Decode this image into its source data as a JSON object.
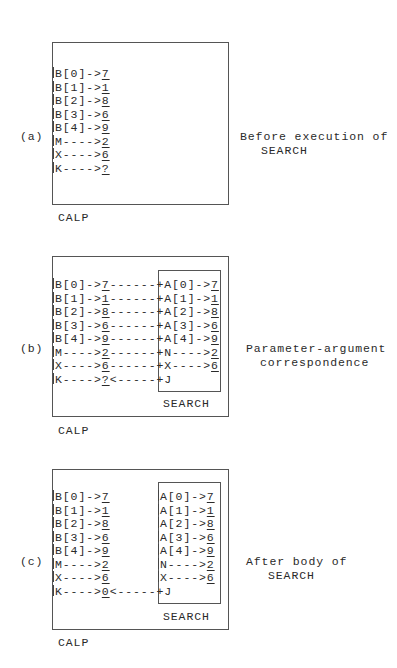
{
  "panels": [
    {
      "label": "(a)",
      "caption_line1": "Before execution of",
      "caption_line2": "SEARCH",
      "outer_box_label": "CALP",
      "has_inner_box": false,
      "rows": [
        {
          "left_name": "B[0]->",
          "left_value": "7",
          "link": "",
          "right_name": "",
          "right_value": ""
        },
        {
          "left_name": "B[1]->",
          "left_value": "1",
          "link": "",
          "right_name": "",
          "right_value": ""
        },
        {
          "left_name": "B[2]->",
          "left_value": "8",
          "link": "",
          "right_name": "",
          "right_value": ""
        },
        {
          "left_name": "B[3]->",
          "left_value": "6",
          "link": "",
          "right_name": "",
          "right_value": ""
        },
        {
          "left_name": "B[4]->",
          "left_value": "9",
          "link": "",
          "right_name": "",
          "right_value": ""
        },
        {
          "left_name": "M---->",
          "left_value": "2",
          "link": "",
          "right_name": "",
          "right_value": ""
        },
        {
          "left_name": "X---->",
          "left_value": "6",
          "link": "",
          "right_name": "",
          "right_value": ""
        },
        {
          "left_name": "K---->",
          "left_value": "?",
          "link": "",
          "right_name": "",
          "right_value": ""
        }
      ]
    },
    {
      "label": "(b)",
      "caption_line1": "Parameter-argument",
      "caption_line2": "correspondence",
      "outer_box_label": "CALP",
      "inner_box_label": "SEARCH",
      "has_inner_box": true,
      "rows": [
        {
          "left_name": "B[0]->",
          "left_value": "7",
          "link": "------+",
          "right_name": "A[0]->",
          "right_value": "7"
        },
        {
          "left_name": "B[1]->",
          "left_value": "1",
          "link": "------+",
          "right_name": "A[1]->",
          "right_value": "1"
        },
        {
          "left_name": "B[2]->",
          "left_value": "8",
          "link": "------+",
          "right_name": "A[2]->",
          "right_value": "8"
        },
        {
          "left_name": "B[3]->",
          "left_value": "6",
          "link": "------+",
          "right_name": "A[3]->",
          "right_value": "6"
        },
        {
          "left_name": "B[4]->",
          "left_value": "9",
          "link": "------+",
          "right_name": "A[4]->",
          "right_value": "9"
        },
        {
          "left_name": "M---->",
          "left_value": "2",
          "link": "------+",
          "right_name": "N---->",
          "right_value": "2"
        },
        {
          "left_name": "X---->",
          "left_value": "6",
          "link": "------+",
          "right_name": "X---->",
          "right_value": "6"
        },
        {
          "left_name": "K---->",
          "left_value": "?",
          "link": "<-----+",
          "right_name": "J",
          "right_value": ""
        }
      ]
    },
    {
      "label": "(c)",
      "caption_line1": "After body of",
      "caption_line2": "SEARCH",
      "outer_box_label": "CALP",
      "inner_box_label": "SEARCH",
      "has_inner_box": true,
      "rows": [
        {
          "left_name": "B[0]->",
          "left_value": "7",
          "link": "",
          "right_name": "A[0]->",
          "right_value": "7"
        },
        {
          "left_name": "B[1]->",
          "left_value": "1",
          "link": "",
          "right_name": "A[1]->",
          "right_value": "1"
        },
        {
          "left_name": "B[2]->",
          "left_value": "8",
          "link": "",
          "right_name": "A[2]->",
          "right_value": "8"
        },
        {
          "left_name": "B[3]->",
          "left_value": "6",
          "link": "",
          "right_name": "A[3]->",
          "right_value": "6"
        },
        {
          "left_name": "B[4]->",
          "left_value": "9",
          "link": "",
          "right_name": "A[4]->",
          "right_value": "9"
        },
        {
          "left_name": "M---->",
          "left_value": "2",
          "link": "",
          "right_name": "N---->",
          "right_value": "2"
        },
        {
          "left_name": "X---->",
          "left_value": "6",
          "link": "",
          "right_name": "X---->",
          "right_value": "6"
        },
        {
          "left_name": "K---->",
          "left_value": "0",
          "link": "<-----+",
          "right_name": "J",
          "right_value": ""
        }
      ]
    }
  ]
}
